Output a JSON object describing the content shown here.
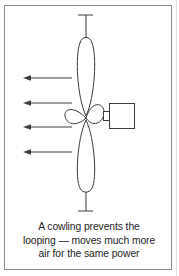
{
  "figure": {
    "caption_lines": [
      "A cowling prevents the",
      "looping — moves much more",
      "air for the same power"
    ],
    "caption": "A cowling prevents the looping — moves much more air for the same power"
  },
  "diagram": {
    "type": "line-drawing",
    "airflow_arrow_count": 4,
    "airflow_direction": "left",
    "parts": [
      "axis-tick-top",
      "propeller-blade-top",
      "hub-blade-left",
      "hub-blade-right",
      "drive-shaft",
      "motor-box",
      "propeller-blade-bottom",
      "axis-tick-bottom"
    ]
  },
  "colors": {
    "background": "#ffffff",
    "line": "#3c3c3c",
    "border": "#8a8a8a",
    "text": "#242424"
  }
}
